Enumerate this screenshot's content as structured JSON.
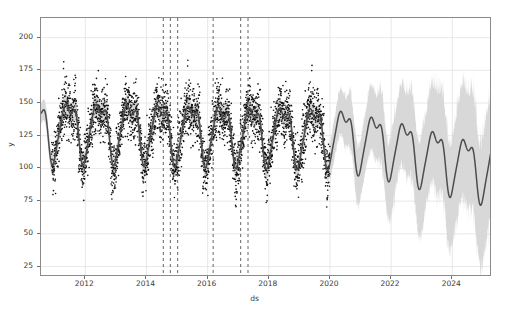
{
  "figure": {
    "title": "",
    "background_color": "#ffffff",
    "width": 509,
    "height": 316
  },
  "axes": {
    "xlabel": "ds",
    "ylabel": "y",
    "spine_color": "#8a8a8a",
    "grid": true,
    "grid_color": "#e2e2e2"
  },
  "chart_data": {
    "type": "line",
    "title": "",
    "xlabel": "ds",
    "ylabel": "y",
    "grid": true,
    "legend": "none",
    "xlim": [
      2010.55,
      2025.3
    ],
    "ylim": [
      17,
      215
    ],
    "xticks": [
      2012,
      2014,
      2016,
      2018,
      2020,
      2022,
      2024
    ],
    "xtick_labels": [
      "2012",
      "2014",
      "2016",
      "2018",
      "2020",
      "2022",
      "2024"
    ],
    "yticks": [
      25,
      50,
      75,
      100,
      125,
      150,
      175,
      200
    ],
    "ytick_labels": [
      "25",
      "50",
      "75",
      "100",
      "125",
      "150",
      "175",
      "200"
    ],
    "history_range": [
      2010.9,
      2020.0
    ],
    "forecast_range": [
      2020.0,
      2025.0
    ],
    "colors": {
      "observations": "#101010",
      "prediction_line": "#4d4d4d",
      "uncertainty_band": "#d6d6d6",
      "changepoint_line": "#555555"
    },
    "series": [
      {
        "name": "yhat",
        "type": "line",
        "color": "#4d4d4d",
        "description": "Prophet prediction: yearly seasonality on a slowly declining linear trend",
        "trend": {
          "x": [
            2010.9,
            2012.0,
            2014.0,
            2016.0,
            2018.0,
            2020.0,
            2022.0,
            2024.0,
            2025.0
          ],
          "y": [
            131,
            131,
            130,
            129,
            128,
            127,
            118,
            106,
            100
          ]
        },
        "seasonality": {
          "period_years": 1.0,
          "amplitude": 26,
          "peak_phase": 0.55,
          "trough_phase": 0.05,
          "shape": "sharp-trough sinusoid with secondary mid-year dip"
        }
      },
      {
        "name": "yhat_lower / yhat_upper",
        "type": "band",
        "color": "#d6d6d6",
        "description": "80% uncertainty interval; narrow over history, widening through the forecast horizon",
        "half_width_history": 9,
        "half_width_forecast_start": 14,
        "half_width_forecast_end": 48
      },
      {
        "name": "y (observations)",
        "type": "scatter",
        "color": "#101010",
        "marker": "o",
        "marker_size": 1.6,
        "n_points_approx": 3300,
        "x_range": [
          2010.9,
          2020.0
        ],
        "y_range": [
          40,
          208
        ],
        "scatter_sigma": 17,
        "description": "Daily observed values over the history window, clustered around the fitted seasonal curve"
      }
    ],
    "changepoints": {
      "style": "dashed vertical lines",
      "color": "#555555",
      "values": [
        2014.55,
        2014.78,
        2015.02,
        2016.18,
        2017.08,
        2017.32
      ]
    }
  }
}
